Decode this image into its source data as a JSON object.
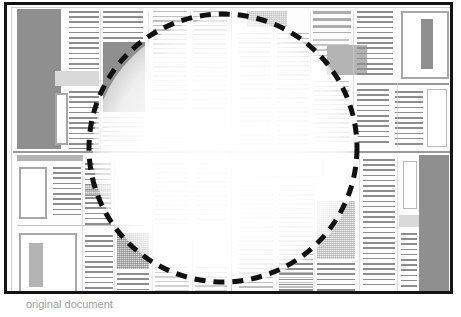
{
  "document": {
    "title": "Scanned newspaper page layout",
    "caption": "original document",
    "page": {
      "width": 449,
      "height": 292,
      "frame_color": "#141414",
      "background": "#fdfdfd"
    }
  },
  "selection": {
    "shape": "circle",
    "label": "region-of-interest",
    "center_x": 223,
    "center_y": 148,
    "radius": 134,
    "stroke_color": "#111111",
    "stroke_width": 5,
    "dash_pattern": "11 8",
    "interior_effect": "faded"
  },
  "legend": {
    "solid_gray": "#8f8f8f",
    "mid_gray": "#b4b4b4",
    "light_gray": "#d9d9d9",
    "rule_gray": "#8e8e8e"
  },
  "layout": {
    "quadrants": [
      {
        "name": "top-left",
        "columns": 4
      },
      {
        "name": "top-right",
        "columns": 4
      },
      {
        "name": "bottom-left",
        "columns": 4
      },
      {
        "name": "bottom-right",
        "columns": 4
      }
    ],
    "dividers": {
      "horizontal_y": 148,
      "vertical_x": 224
    },
    "regions": [
      {
        "name": "masthead-photo-left",
        "type": "art-dark",
        "x": 10,
        "y": 4,
        "w": 44,
        "h": 140
      },
      {
        "name": "column-1-text",
        "type": "text",
        "x": 62,
        "y": 6,
        "w": 30,
        "h": 60
      },
      {
        "name": "column-1-caption-box",
        "type": "art-light",
        "x": 50,
        "y": 68,
        "w": 42,
        "h": 14
      },
      {
        "name": "column-1-sidebar-box",
        "type": "art-frame",
        "x": 50,
        "y": 92,
        "w": 12,
        "h": 50
      },
      {
        "name": "column-2-text",
        "type": "text",
        "x": 66,
        "y": 6,
        "w": 28,
        "h": 138
      },
      {
        "name": "column-3-photo",
        "type": "art-dark",
        "x": 96,
        "y": 37,
        "w": 42,
        "h": 71
      },
      {
        "name": "column-3-text",
        "type": "text",
        "x": 96,
        "y": 6,
        "w": 42,
        "h": 28
      },
      {
        "name": "column-4-text",
        "type": "text",
        "x": 146,
        "y": 6,
        "w": 34,
        "h": 98
      },
      {
        "name": "column-5-text",
        "type": "text",
        "x": 186,
        "y": 6,
        "w": 34,
        "h": 98
      },
      {
        "name": "top-wide-box",
        "type": "art-frame-thin",
        "x": 148,
        "y": 110,
        "w": 72,
        "h": 18
      },
      {
        "name": "tr-halftone-banner",
        "type": "halftone",
        "x": 242,
        "y": 6,
        "w": 38,
        "h": 16
      },
      {
        "name": "tr-column-a",
        "type": "text",
        "x": 234,
        "y": 28,
        "w": 30,
        "h": 112
      },
      {
        "name": "tr-column-b",
        "type": "text",
        "x": 270,
        "y": 28,
        "w": 30,
        "h": 112
      },
      {
        "name": "tr-headline",
        "type": "headline",
        "x": 306,
        "y": 6,
        "w": 38,
        "h": 22
      },
      {
        "name": "tr-photo",
        "type": "art-mid",
        "x": 320,
        "y": 38,
        "w": 40,
        "h": 30
      },
      {
        "name": "tr-column-c",
        "type": "text",
        "x": 306,
        "y": 74,
        "w": 36,
        "h": 66
      },
      {
        "name": "tr-column-d",
        "type": "text",
        "x": 350,
        "y": 6,
        "w": 36,
        "h": 70
      },
      {
        "name": "tr-ad-frame",
        "type": "art-frame",
        "x": 396,
        "y": 6,
        "w": 46,
        "h": 66
      },
      {
        "name": "tr-ad-bar",
        "type": "art-dark",
        "x": 414,
        "y": 14,
        "w": 12,
        "h": 48
      },
      {
        "name": "tr-lower-rule",
        "type": "hrule",
        "x": 350,
        "y": 78,
        "w": 92,
        "h": 2
      },
      {
        "name": "tr-lower-text",
        "type": "text",
        "x": 350,
        "y": 84,
        "w": 32,
        "h": 56
      },
      {
        "name": "tr-lower-text2",
        "type": "text",
        "x": 388,
        "y": 86,
        "w": 28,
        "h": 54
      },
      {
        "name": "tr-lower-box",
        "type": "art-frame-thin",
        "x": 420,
        "y": 84,
        "w": 20,
        "h": 58
      },
      {
        "name": "bl-banner",
        "type": "art-mid",
        "x": 10,
        "y": 150,
        "w": 66,
        "h": 6
      },
      {
        "name": "bl-photo-frame",
        "type": "art-frame",
        "x": 12,
        "y": 162,
        "w": 28,
        "h": 50
      },
      {
        "name": "bl-column-a",
        "type": "text",
        "x": 44,
        "y": 162,
        "w": 30,
        "h": 52
      },
      {
        "name": "bl-column-b",
        "type": "text",
        "x": 78,
        "y": 160,
        "w": 26,
        "h": 60
      },
      {
        "name": "bl-lower-frame",
        "type": "art-frame",
        "x": 12,
        "y": 224,
        "w": 58,
        "h": 64
      },
      {
        "name": "bl-lower-bar",
        "type": "art-mid",
        "x": 22,
        "y": 234,
        "w": 14,
        "h": 46
      },
      {
        "name": "bl-column-c",
        "type": "text",
        "x": 78,
        "y": 228,
        "w": 28,
        "h": 58
      },
      {
        "name": "bl-photo-halftone",
        "type": "halftone",
        "x": 110,
        "y": 228,
        "w": 32,
        "h": 36
      },
      {
        "name": "bl-column-d",
        "type": "text",
        "x": 110,
        "y": 268,
        "w": 32,
        "h": 20
      },
      {
        "name": "br-box",
        "type": "art-frame-thin",
        "x": 236,
        "y": 156,
        "w": 80,
        "h": 16
      },
      {
        "name": "br-column-a",
        "type": "text",
        "x": 234,
        "y": 180,
        "w": 34,
        "h": 104
      },
      {
        "name": "br-column-b",
        "type": "text",
        "x": 274,
        "y": 180,
        "w": 34,
        "h": 104
      },
      {
        "name": "br-photo",
        "type": "halftone-lite",
        "x": 312,
        "y": 196,
        "w": 36,
        "h": 56
      },
      {
        "name": "br-column-c",
        "type": "text",
        "x": 356,
        "y": 156,
        "w": 32,
        "h": 128
      },
      {
        "name": "br-side-frame",
        "type": "art-frame-thin",
        "x": 398,
        "y": 156,
        "w": 14,
        "h": 48
      },
      {
        "name": "br-side-bar",
        "type": "art-light",
        "x": 394,
        "y": 212,
        "w": 40,
        "h": 12
      },
      {
        "name": "br-big-photo",
        "type": "art-dark",
        "x": 414,
        "y": 150,
        "w": 28,
        "h": 138
      }
    ]
  }
}
